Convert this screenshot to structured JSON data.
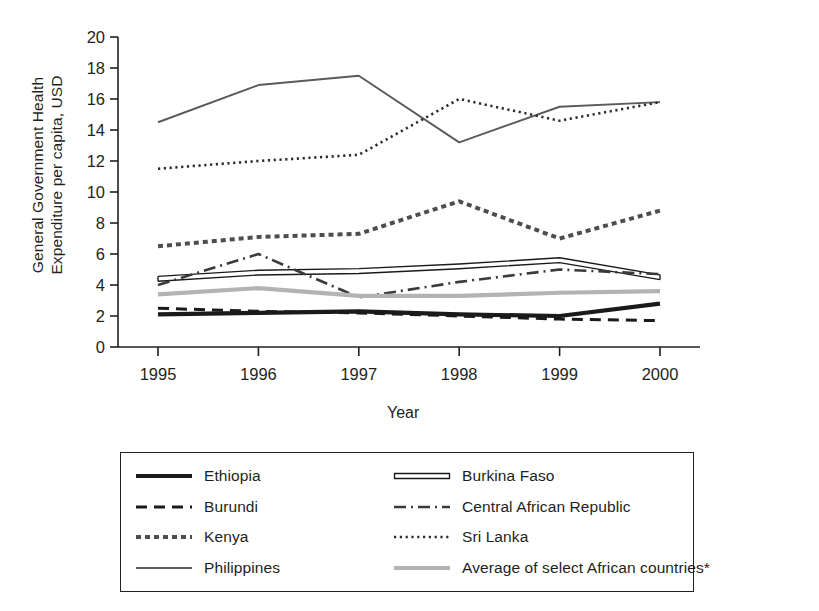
{
  "chart_data": {
    "type": "line",
    "title": "",
    "xlabel": "Year",
    "ylabel": "General Government Health Expenditure per capita, USD",
    "ylabel_line1": "General Government Health",
    "ylabel_line2": "Expenditure per capita, USD",
    "categories": [
      "1995",
      "1996",
      "1997",
      "1998",
      "1999",
      "2000"
    ],
    "x": [
      1995,
      1996,
      1997,
      1998,
      1999,
      2000
    ],
    "ylim": [
      0,
      20
    ],
    "yticks": [
      "0",
      "2",
      "4",
      "6",
      "8",
      "10",
      "12",
      "14",
      "16",
      "18",
      "20"
    ],
    "ytick_values": [
      0,
      2,
      4,
      6,
      8,
      10,
      12,
      14,
      16,
      18,
      20
    ],
    "grid": false,
    "legend_position": "below-plot",
    "legend_columns": 2,
    "footnote_marker": "*",
    "series": [
      {
        "name": "Ethiopia",
        "style": "solid-thick",
        "color": "#1a1a1a",
        "values": [
          2.1,
          2.2,
          2.3,
          2.1,
          2.0,
          2.8
        ]
      },
      {
        "name": "Burundi",
        "style": "dashed",
        "color": "#1a1a1a",
        "values": [
          2.5,
          2.3,
          2.2,
          2.0,
          1.8,
          1.7
        ]
      },
      {
        "name": "Kenya",
        "style": "dotted-thick",
        "color": "#4d4d4d",
        "values": [
          6.5,
          7.1,
          7.3,
          9.4,
          7.0,
          8.8
        ]
      },
      {
        "name": "Philippines",
        "style": "solid-medium",
        "color": "#5a5a5a",
        "values": [
          14.5,
          16.9,
          17.5,
          13.2,
          15.5,
          15.8
        ]
      },
      {
        "name": "Burkina Faso",
        "style": "double-hollow",
        "color": "#1a1a1a",
        "values": [
          4.4,
          4.8,
          4.9,
          5.2,
          5.6,
          4.5
        ]
      },
      {
        "name": "Central African Republic",
        "style": "dash-dot",
        "color": "#3a3a3a",
        "values": [
          4.0,
          6.0,
          3.2,
          4.2,
          5.0,
          4.7
        ]
      },
      {
        "name": "Sri Lanka",
        "style": "dotted-fine",
        "color": "#2b2b2b",
        "values": [
          11.5,
          12.0,
          12.4,
          16.0,
          14.6,
          15.8
        ]
      },
      {
        "name": "Average of select African countries*",
        "style": "solid-gray",
        "color": "#b3b3b3",
        "values": [
          3.4,
          3.8,
          3.3,
          3.3,
          3.5,
          3.6
        ]
      }
    ]
  },
  "legend": {
    "items": [
      {
        "label": "Ethiopia",
        "swatch": "solid-thick"
      },
      {
        "label": "Burkina Faso",
        "swatch": "double-hollow"
      },
      {
        "label": "Burundi",
        "swatch": "dashed"
      },
      {
        "label": "Central African Republic",
        "swatch": "dash-dot"
      },
      {
        "label": "Kenya",
        "swatch": "dotted-thick"
      },
      {
        "label": "Sri Lanka",
        "swatch": "dotted-fine"
      },
      {
        "label": "Philippines",
        "swatch": "solid-medium"
      },
      {
        "label": "Average of select African countries*",
        "swatch": "solid-gray"
      }
    ]
  },
  "colors": {
    "axis": "#231f20",
    "text": "#231f20",
    "background": "#ffffff"
  }
}
